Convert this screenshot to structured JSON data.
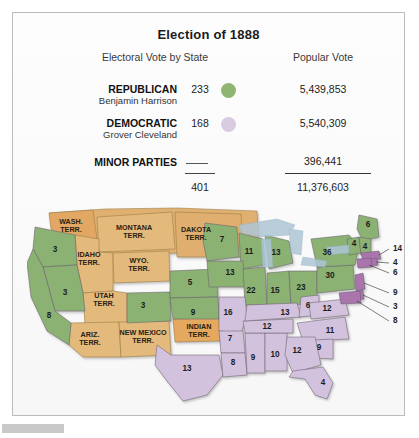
{
  "title": "Election of 1888",
  "headers": {
    "electoral": "Electoral Vote by State",
    "popular": "Popular Vote"
  },
  "legend": {
    "republican": {
      "party": "REPUBLICAN",
      "candidate": "Benjamin Harrison",
      "electoral": "233",
      "popular": "5,439,853",
      "color": "#8fb573"
    },
    "democratic": {
      "party": "DEMOCRATIC",
      "candidate": "Grover Cleveland",
      "electoral": "168",
      "popular": "5,540,309",
      "color": "#d9cce2"
    },
    "minor": {
      "party": "MINOR PARTIES",
      "electoral": "—",
      "popular": "396,441"
    },
    "totals": {
      "electoral": "401",
      "popular": "11,376,603"
    }
  },
  "map": {
    "republican_color": "#8bb173",
    "democratic_color": "#d3c2dd",
    "territory_color": "#e0b071",
    "water_color": "#aec6d6",
    "territories": [
      {
        "name": "WASH. TERR.",
        "x": 44,
        "y": 19
      },
      {
        "name": "MONTANA TERR.",
        "x": 107,
        "y": 25
      },
      {
        "name": "DAKOTA TERR.",
        "x": 169,
        "y": 27
      },
      {
        "name": "IDAHO TERR.",
        "x": 62,
        "y": 52
      },
      {
        "name": "WYO. TERR.",
        "x": 112,
        "y": 58
      },
      {
        "name": "UTAH TERR.",
        "x": 77,
        "y": 93
      },
      {
        "name": "ARIZ. TERR.",
        "x": 63,
        "y": 132
      },
      {
        "name": "NEW MEXICO TERR.",
        "x": 116,
        "y": 130
      },
      {
        "name": "INDIAN TERR.",
        "x": 172,
        "y": 124
      }
    ],
    "states": [
      {
        "name": "Oregon",
        "votes": "3",
        "party": "republican",
        "x": 28,
        "y": 47
      },
      {
        "name": "Nevada",
        "votes": "3",
        "party": "republican",
        "x": 38,
        "y": 90
      },
      {
        "name": "California",
        "votes": "8",
        "party": "republican",
        "x": 22,
        "y": 113
      },
      {
        "name": "Colorado",
        "votes": "3",
        "party": "republican",
        "x": 116,
        "y": 103
      },
      {
        "name": "Nebraska",
        "votes": "5",
        "party": "republican",
        "x": 163,
        "y": 80
      },
      {
        "name": "Kansas",
        "votes": "9",
        "party": "republican",
        "x": 166,
        "y": 110
      },
      {
        "name": "Minnesota",
        "votes": "7",
        "party": "republican",
        "x": 195,
        "y": 37
      },
      {
        "name": "Wisconsin",
        "votes": "11",
        "party": "republican",
        "x": 222,
        "y": 49
      },
      {
        "name": "Iowa",
        "votes": "13",
        "party": "republican",
        "x": 203,
        "y": 70
      },
      {
        "name": "Illinois",
        "votes": "22",
        "party": "republican",
        "x": 224,
        "y": 88
      },
      {
        "name": "Michigan",
        "votes": "13",
        "party": "republican",
        "x": 249,
        "y": 50
      },
      {
        "name": "Indiana",
        "votes": "15",
        "party": "republican",
        "x": 248,
        "y": 88
      },
      {
        "name": "Ohio",
        "votes": "23",
        "party": "republican",
        "x": 274,
        "y": 85
      },
      {
        "name": "Pennsylvania",
        "votes": "30",
        "party": "republican",
        "x": 303,
        "y": 73
      },
      {
        "name": "New York",
        "votes": "36",
        "party": "republican",
        "x": 300,
        "y": 50
      },
      {
        "name": "Maine",
        "votes": "6",
        "party": "republican",
        "x": 341,
        "y": 22
      },
      {
        "name": "Vermont",
        "votes": "4",
        "party": "republican",
        "x": 327,
        "y": 41
      },
      {
        "name": "New Hampshire",
        "votes": "4",
        "party": "republican",
        "x": 338,
        "y": 44
      },
      {
        "name": "Missouri",
        "votes": "16",
        "party": "democratic",
        "x": 201,
        "y": 110
      },
      {
        "name": "Texas",
        "votes": "13",
        "party": "democratic",
        "x": 160,
        "y": 166
      },
      {
        "name": "Arkansas",
        "votes": "7",
        "party": "democratic",
        "x": 203,
        "y": 136
      },
      {
        "name": "Louisiana",
        "votes": "8",
        "party": "democratic",
        "x": 206,
        "y": 160
      },
      {
        "name": "Mississippi",
        "votes": "9",
        "party": "democratic",
        "x": 226,
        "y": 155
      },
      {
        "name": "Alabama",
        "votes": "10",
        "party": "democratic",
        "x": 248,
        "y": 152
      },
      {
        "name": "Tennessee",
        "votes": "12",
        "party": "democratic",
        "x": 240,
        "y": 124
      },
      {
        "name": "Kentucky",
        "votes": "13",
        "party": "democratic",
        "x": 258,
        "y": 110
      },
      {
        "name": "West Virginia",
        "votes": "6",
        "party": "democratic",
        "x": 281,
        "y": 103
      },
      {
        "name": "Virginia",
        "votes": "12",
        "party": "democratic",
        "x": 300,
        "y": 106
      },
      {
        "name": "North Carolina",
        "votes": "11",
        "party": "democratic",
        "x": 303,
        "y": 128
      },
      {
        "name": "South Carolina",
        "votes": "9",
        "party": "democratic",
        "x": 292,
        "y": 145
      },
      {
        "name": "Georgia",
        "votes": "12",
        "party": "democratic",
        "x": 270,
        "y": 148
      },
      {
        "name": "Florida",
        "votes": "4",
        "party": "democratic",
        "x": 296,
        "y": 180
      }
    ],
    "leader_labels": [
      {
        "name": "Massachusetts",
        "votes": "14",
        "x": 366,
        "y": 46
      },
      {
        "name": "Rhode Island",
        "votes": "4",
        "x": 366,
        "y": 60
      },
      {
        "name": "Connecticut",
        "votes": "6",
        "x": 366,
        "y": 70
      },
      {
        "name": "New Jersey",
        "votes": "9",
        "x": 366,
        "y": 90
      },
      {
        "name": "Delaware",
        "votes": "3",
        "x": 366,
        "y": 104
      },
      {
        "name": "Maryland",
        "votes": "8",
        "x": 366,
        "y": 118
      }
    ]
  }
}
